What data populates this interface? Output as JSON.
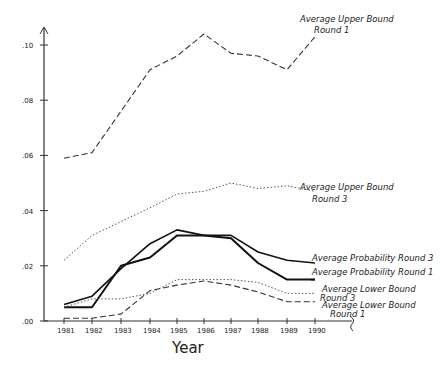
{
  "chart_data": {
    "type": "line",
    "title": "",
    "xlabel": "Year",
    "ylabel": "",
    "x": [
      1981,
      1982,
      1983,
      1984,
      1985,
      1986,
      1987,
      1988,
      1989,
      1990
    ],
    "x_tick_labels": [
      "1981",
      "1982",
      "1983",
      "1984",
      "1985",
      "1986",
      "1987",
      "1988",
      "1989",
      "1990"
    ],
    "y_tick_labels": [
      ".00",
      ".02",
      ".04",
      ".06",
      ".08",
      ".10"
    ],
    "y_ticks": [
      0.0,
      0.02,
      0.04,
      0.06,
      0.08,
      0.1
    ],
    "ylim": [
      0,
      0.105
    ],
    "grid": false,
    "legend_position": "inline-right",
    "series": [
      {
        "name": "Average Upper Bound Round 1",
        "label_lines": [
          "Average Upper Bound",
          "Round 1"
        ],
        "style": "long-dash",
        "values": [
          0.059,
          0.061,
          0.076,
          0.091,
          0.096,
          0.104,
          0.097,
          0.096,
          0.091,
          0.103
        ]
      },
      {
        "name": "Average Upper Bound Round 3",
        "label_lines": [
          "Average Upper Bound",
          "Round 3"
        ],
        "style": "dotted",
        "values": [
          0.022,
          0.031,
          0.036,
          0.041,
          0.046,
          0.047,
          0.05,
          0.048,
          0.049,
          0.047
        ]
      },
      {
        "name": "Average Probability Round 3",
        "label_lines": [
          "Average Probability Round 3"
        ],
        "style": "solid",
        "values": [
          0.006,
          0.009,
          0.019,
          0.028,
          0.033,
          0.031,
          0.031,
          0.025,
          0.022,
          0.021
        ]
      },
      {
        "name": "Average Probability Round 1",
        "label_lines": [
          "Average Probability Round 1"
        ],
        "style": "solid-thick",
        "values": [
          0.005,
          0.005,
          0.02,
          0.023,
          0.031,
          0.031,
          0.03,
          0.021,
          0.015,
          0.015
        ]
      },
      {
        "name": "Average Lower Bound Round 3",
        "label_lines": [
          "Average Lower Bound",
          "Round 3"
        ],
        "style": "dotted",
        "values": [
          0.005,
          0.008,
          0.008,
          0.01,
          0.015,
          0.015,
          0.015,
          0.014,
          0.01,
          0.01
        ]
      },
      {
        "name": "Average Lower Bound Round 1",
        "label_lines": [
          "Average Lower Bound",
          "Round 1"
        ],
        "style": "long-dash",
        "values": [
          0.001,
          0.001,
          0.0025,
          0.011,
          0.013,
          0.0145,
          0.013,
          0.0105,
          0.007,
          0.007
        ]
      }
    ]
  }
}
